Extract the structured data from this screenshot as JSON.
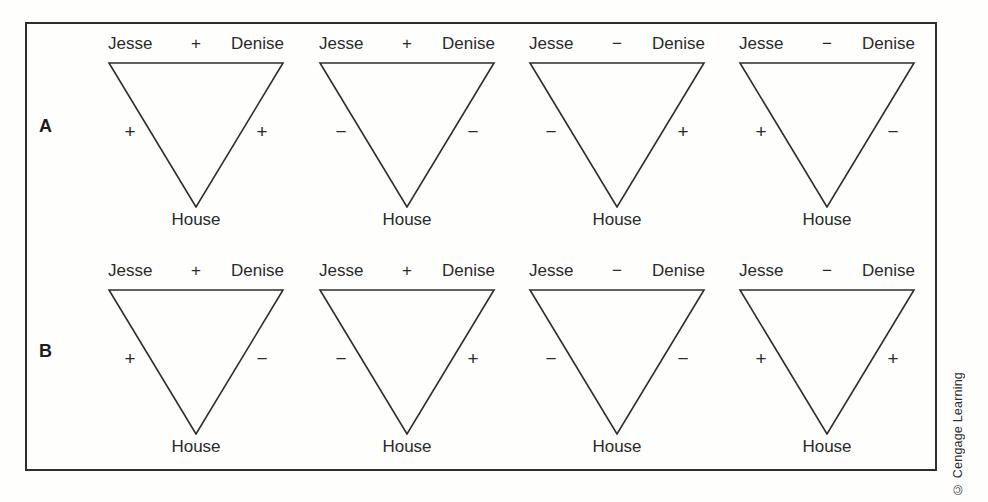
{
  "figure": {
    "row_labels": {
      "a": "A",
      "b": "B"
    },
    "labels": {
      "left": "Jesse",
      "right": "Denise",
      "bottom": "House"
    },
    "rows": [
      {
        "id": "A",
        "triads": [
          {
            "top": "+",
            "left": "+",
            "right": "+"
          },
          {
            "top": "+",
            "left": "−",
            "right": "−"
          },
          {
            "top": "−",
            "left": "−",
            "right": "+"
          },
          {
            "top": "−",
            "left": "+",
            "right": "−"
          }
        ]
      },
      {
        "id": "B",
        "triads": [
          {
            "top": "+",
            "left": "+",
            "right": "−"
          },
          {
            "top": "+",
            "left": "−",
            "right": "+"
          },
          {
            "top": "−",
            "left": "−",
            "right": "−"
          },
          {
            "top": "−",
            "left": "+",
            "right": "+"
          }
        ]
      }
    ],
    "credit": "© Cengage Learning",
    "colors": {
      "ink": "#2e2e2e",
      "background": "#fefefd"
    }
  }
}
